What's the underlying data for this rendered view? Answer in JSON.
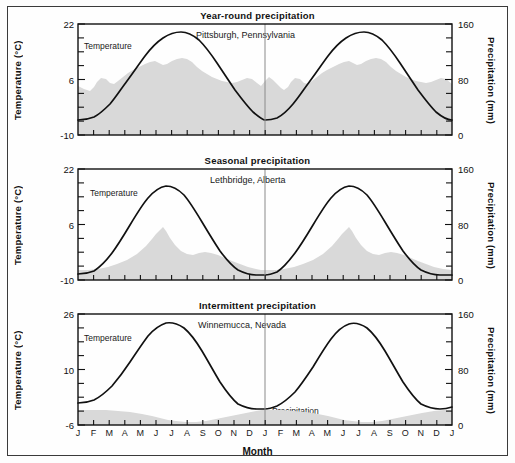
{
  "figure": {
    "xlabel": "Month",
    "series_labels": {
      "temperature": "Temperature",
      "precipitation": "Precipitation"
    },
    "left_axis_title": "Temperature (°C)",
    "right_axis_title": "Precipitation (mm)",
    "month_labels": [
      "J",
      "F",
      "M",
      "A",
      "M",
      "J",
      "J",
      "A",
      "S",
      "O",
      "N",
      "D",
      "J",
      "F",
      "M",
      "A",
      "M",
      "J",
      "J",
      "A",
      "S",
      "O",
      "N",
      "D",
      "J"
    ],
    "colors": {
      "line": "#111111",
      "precip_fill": "#d9d9d9",
      "frame": "#3a3a3a",
      "divider": "#8a8a8a"
    }
  },
  "chart_data": [
    {
      "type": "area",
      "title": "Year-round precipitation",
      "city": "Pittsburgh, Pennsylvania",
      "xlabel": "Month",
      "ylabel": "Temperature (°C)",
      "y2label": "Precipitation (mm)",
      "ylim": [
        -10,
        22
      ],
      "yticks": [
        -10,
        6,
        22
      ],
      "ytick_labels": [
        "-10",
        "6",
        "22"
      ],
      "y2lim": [
        0,
        160
      ],
      "y2ticks": [
        0,
        80,
        160
      ],
      "y2tick_labels": [
        "0",
        "80",
        "160"
      ],
      "grid": false,
      "legend": "inline",
      "categories": [
        "J",
        "F",
        "M",
        "A",
        "M",
        "J",
        "J",
        "A",
        "S",
        "O",
        "N",
        "D"
      ],
      "series": [
        {
          "name": "Temperature",
          "unit": "°C",
          "axis": "left",
          "values": [
            -1.0,
            0.0,
            5.0,
            11.5,
            17.0,
            21.0,
            21.5,
            20.5,
            17.0,
            11.0,
            5.0,
            0.5
          ]
        },
        {
          "name": "Precipitation",
          "unit": "mm",
          "axis": "right",
          "values": [
            70,
            63,
            82,
            80,
            92,
            94,
            96,
            84,
            72,
            62,
            70,
            68
          ]
        }
      ]
    },
    {
      "type": "area",
      "title": "Seasonal precipitation",
      "city": "Lethbridge, Alberta",
      "xlabel": "Month",
      "ylabel": "Temperature (°C)",
      "y2label": "Precipitation (mm)",
      "ylim": [
        -10,
        22
      ],
      "yticks": [
        -10,
        6,
        22
      ],
      "ytick_labels": [
        "-10",
        "6",
        "22"
      ],
      "y2lim": [
        0,
        160
      ],
      "y2ticks": [
        0,
        80,
        160
      ],
      "y2tick_labels": [
        "0",
        "80",
        "160"
      ],
      "grid": false,
      "legend": "inline",
      "categories": [
        "J",
        "F",
        "M",
        "A",
        "M",
        "J",
        "J",
        "A",
        "S",
        "O",
        "N",
        "D"
      ],
      "series": [
        {
          "name": "Temperature",
          "unit": "°C",
          "axis": "left",
          "values": [
            -8.5,
            -6.0,
            -1.0,
            6.0,
            11.5,
            15.5,
            17.5,
            16.5,
            11.0,
            5.5,
            -2.0,
            -7.0
          ]
        },
        {
          "name": "Precipitation",
          "unit": "mm",
          "axis": "right",
          "values": [
            14,
            14,
            20,
            34,
            52,
            70,
            38,
            34,
            30,
            20,
            16,
            14
          ]
        }
      ]
    },
    {
      "type": "area",
      "title": "Intermittent precipitation",
      "city": "Winnemucca, Nevada",
      "xlabel": "Month",
      "ylabel": "Temperature (°C)",
      "y2label": "Precipitation (mm)",
      "ylim": [
        -6,
        26
      ],
      "yticks": [
        -6,
        10,
        26
      ],
      "ytick_labels": [
        "-6",
        "10",
        "26"
      ],
      "y2lim": [
        0,
        160
      ],
      "y2ticks": [
        0,
        80,
        160
      ],
      "y2tick_labels": [
        "0",
        "80",
        "160"
      ],
      "grid": false,
      "legend": "inline",
      "categories": [
        "J",
        "F",
        "M",
        "A",
        "M",
        "J",
        "J",
        "A",
        "S",
        "O",
        "N",
        "D"
      ],
      "series": [
        {
          "name": "Temperature",
          "unit": "°C",
          "axis": "left",
          "values": [
            -0.5,
            2.0,
            5.5,
            9.5,
            14.5,
            19.5,
            24.0,
            23.0,
            17.5,
            11.0,
            4.0,
            -0.5
          ]
        },
        {
          "name": "Precipitation",
          "unit": "mm",
          "axis": "right",
          "values": [
            22,
            21,
            20,
            17,
            14,
            10,
            8,
            8,
            11,
            15,
            20,
            22
          ]
        }
      ]
    }
  ],
  "panels": [
    {
      "title": "Year-round precipitation",
      "city": "Pittsburgh, Pennsylvania",
      "temp_label": "Temperature",
      "precip_label": "Precipitation",
      "left_title": "Temperature (°C)",
      "right_title": "Precipitation (mm)",
      "ytop": "22",
      "ymid": "6",
      "ybot": "-10",
      "y2top": "160",
      "y2mid": "80",
      "y2bot": "0"
    },
    {
      "title": "Seasonal precipitation",
      "city": "Lethbridge, Alberta",
      "temp_label": "Temperature",
      "precip_label": "Precipitation",
      "left_title": "Temperature (°C)",
      "right_title": "Precipitation (mm)",
      "ytop": "22",
      "ymid": "6",
      "ybot": "-10",
      "y2top": "160",
      "y2mid": "80",
      "y2bot": "0"
    },
    {
      "title": "Intermittent precipitation",
      "city": "Winnemucca, Nevada",
      "temp_label": "Temperature",
      "precip_label": "Precipitation",
      "left_title": "Temperature (°C)",
      "right_title": "Precipitation (mm)",
      "ytop": "26",
      "ymid": "10",
      "ybot": "-6",
      "y2top": "160",
      "y2mid": "80",
      "y2bot": "0"
    }
  ]
}
